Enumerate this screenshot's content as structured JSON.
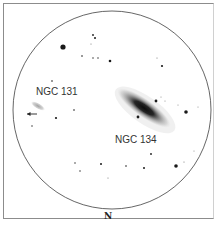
{
  "sketch": {
    "field_circle": {
      "cx": 112,
      "cy": 110,
      "r": 99
    },
    "colors": {
      "ink": "#1a1a1a",
      "circle": "#555555",
      "frame": "#8c8c8c"
    },
    "labels": {
      "galaxy_a": "NGC 131",
      "galaxy_b": "NGC 134",
      "orientation": "N"
    },
    "galaxies": [
      {
        "name": "NGC 134",
        "cx": 144,
        "cy": 108,
        "rx": 32,
        "ry": 9,
        "angle": 35
      },
      {
        "name": "NGC 131",
        "cx": 38,
        "cy": 106,
        "rx": 8,
        "ry": 3,
        "angle": 30
      }
    ],
    "stars": [
      {
        "x": 63,
        "y": 47,
        "r": 2.6
      },
      {
        "x": 93,
        "y": 35,
        "r": 0.9
      },
      {
        "x": 95,
        "y": 38,
        "r": 1.0
      },
      {
        "x": 91,
        "y": 44,
        "r": 0.6
      },
      {
        "x": 82,
        "y": 56,
        "r": 0.8
      },
      {
        "x": 93,
        "y": 58,
        "r": 0.7
      },
      {
        "x": 98,
        "y": 58,
        "r": 0.7
      },
      {
        "x": 110,
        "y": 61,
        "r": 1.3
      },
      {
        "x": 157,
        "y": 58,
        "r": 0.6
      },
      {
        "x": 162,
        "y": 66,
        "r": 1.1
      },
      {
        "x": 52,
        "y": 81,
        "r": 0.8
      },
      {
        "x": 156,
        "y": 101,
        "r": 1.4
      },
      {
        "x": 161,
        "y": 97,
        "r": 0.5
      },
      {
        "x": 165,
        "y": 101,
        "r": 0.5
      },
      {
        "x": 178,
        "y": 105,
        "r": 0.5
      },
      {
        "x": 186,
        "y": 112,
        "r": 1.8
      },
      {
        "x": 198,
        "y": 107,
        "r": 0.5
      },
      {
        "x": 138,
        "y": 117,
        "r": 1.4
      },
      {
        "x": 56,
        "y": 118,
        "r": 1.1
      },
      {
        "x": 74,
        "y": 110,
        "r": 0.8
      },
      {
        "x": 32,
        "y": 126,
        "r": 0.7
      },
      {
        "x": 151,
        "y": 154,
        "r": 0.9
      },
      {
        "x": 144,
        "y": 168,
        "r": 1.0
      },
      {
        "x": 176,
        "y": 166,
        "r": 1.8
      },
      {
        "x": 184,
        "y": 162,
        "r": 0.6
      },
      {
        "x": 194,
        "y": 151,
        "r": 0.5
      },
      {
        "x": 75,
        "y": 163,
        "r": 0.7
      },
      {
        "x": 80,
        "y": 171,
        "r": 0.7
      },
      {
        "x": 101,
        "y": 164,
        "r": 1.0
      },
      {
        "x": 126,
        "y": 166,
        "r": 0.8
      },
      {
        "x": 108,
        "y": 178,
        "r": 0.6
      }
    ],
    "arrow": {
      "x1": 37,
      "y1": 114,
      "x2": 27,
      "y2": 114,
      "direction": "left"
    }
  }
}
